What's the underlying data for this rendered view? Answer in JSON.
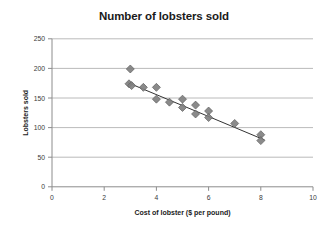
{
  "chart_data": {
    "type": "scatter",
    "title": "Number of lobsters sold",
    "xlabel": "Cost of lobster ($ per pound)",
    "ylabel": "Lobsters sold",
    "xlim": [
      0,
      10
    ],
    "ylim": [
      0,
      250
    ],
    "xticks": [
      0,
      2,
      4,
      6,
      8,
      10
    ],
    "yticks": [
      0,
      50,
      100,
      150,
      200,
      250
    ],
    "grid": "horizontal",
    "legend": "none",
    "marker_shape": "diamond",
    "marker_color": "#808080",
    "marker_edge_color": "#5e5e5e",
    "trendline_color": "#333333",
    "points": [
      {
        "x": 3.0,
        "y": 199
      },
      {
        "x": 2.95,
        "y": 174
      },
      {
        "x": 3.05,
        "y": 171
      },
      {
        "x": 3.5,
        "y": 168
      },
      {
        "x": 4.0,
        "y": 168
      },
      {
        "x": 4.0,
        "y": 148
      },
      {
        "x": 4.5,
        "y": 143
      },
      {
        "x": 5.0,
        "y": 148
      },
      {
        "x": 5.0,
        "y": 134
      },
      {
        "x": 5.5,
        "y": 138
      },
      {
        "x": 5.5,
        "y": 123
      },
      {
        "x": 6.0,
        "y": 128
      },
      {
        "x": 6.0,
        "y": 117
      },
      {
        "x": 7.0,
        "y": 107
      },
      {
        "x": 8.0,
        "y": 88
      },
      {
        "x": 8.0,
        "y": 78
      }
    ],
    "trendline": {
      "x1": 2.9,
      "y1": 176,
      "x2": 8.15,
      "y2": 79
    }
  }
}
